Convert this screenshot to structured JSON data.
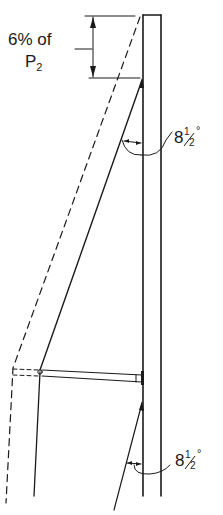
{
  "diagram": {
    "dimension_label": {
      "line1": "6% of",
      "line2_main": "P",
      "line2_sub": "2"
    },
    "angle_upper": {
      "whole": "8",
      "fraction_num": "1",
      "fraction_den": "2",
      "degree": "°"
    },
    "angle_lower": {
      "whole": "8",
      "fraction_num": "1",
      "fraction_den": "2",
      "degree": "°"
    },
    "colors": {
      "ink": "#1a1a1a",
      "background": "#ffffff"
    }
  }
}
